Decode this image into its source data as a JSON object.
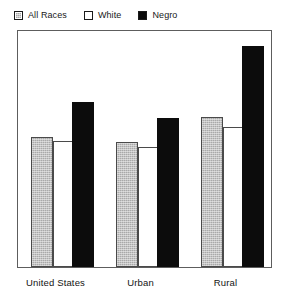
{
  "chart_data": {
    "type": "bar",
    "title": "",
    "subtitle": "",
    "xlabel": "",
    "ylabel": "",
    "grid": false,
    "legend_position": "top-left",
    "categories": [
      "United States",
      "Urban",
      "Rural"
    ],
    "axis": {
      "ylim": [
        0,
        100
      ],
      "y_ticks_visible": false,
      "x_ticks_visible": false
    },
    "series": [
      {
        "name": "All Races",
        "swatch": "gray-hatched",
        "color": "#a9a9a9",
        "values": [
          54.5,
          52.5,
          63.0
        ]
      },
      {
        "name": "White",
        "swatch": "white-outline",
        "color": "#ffffff",
        "values": [
          53.0,
          50.5,
          59.0
        ]
      },
      {
        "name": "Negro",
        "swatch": "black-solid",
        "color": "#0c0c0c",
        "values": [
          69.5,
          62.5,
          93.0
        ]
      }
    ]
  },
  "legend": {
    "entries": [
      {
        "label": "All Races",
        "swatch": "gray-hatched"
      },
      {
        "label": "White",
        "swatch": "white-outline"
      },
      {
        "label": "Negro",
        "swatch": "black-solid"
      }
    ]
  },
  "x_axis": {
    "labels": [
      "United States",
      "Urban",
      "Rural"
    ]
  },
  "colors": {
    "all_races": "#a9a9a9",
    "white": "#ffffff",
    "negro": "#0c0c0c",
    "frame": "#5d5d5d",
    "text": "#131313",
    "background": "#ffffff"
  }
}
